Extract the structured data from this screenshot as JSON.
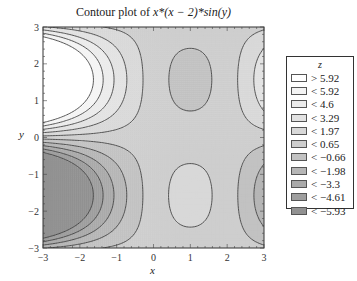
{
  "title": "Contour plot of x*(x − 2)*sin(y)",
  "title_parts": {
    "prefix": "Contour plot of ",
    "expr": "x*(x − 2)*sin(y)"
  },
  "chart_data": {
    "type": "contour",
    "title": "Contour plot of x*(x − 2)*sin(y)",
    "function": "x*(x-2)*sin(y)",
    "xlabel": "x",
    "ylabel": "y",
    "xlim": [
      -3,
      3
    ],
    "ylim": [
      -3,
      3
    ],
    "xticks": [
      -3,
      -2,
      -1,
      0,
      1,
      2,
      3
    ],
    "yticks": [
      -3,
      -2,
      -1,
      0,
      1,
      2,
      3
    ],
    "legend_title": "z",
    "legend_position": "right",
    "levels": [
      5.92,
      4.6,
      3.29,
      1.97,
      0.65,
      -0.66,
      -1.98,
      -3.3,
      -4.61,
      -5.93
    ],
    "legend": [
      {
        "label": "> 5.92",
        "color": "#ffffff"
      },
      {
        "label": "< 5.92",
        "color": "#f4f4f4"
      },
      {
        "label": "< 4.6",
        "color": "#ebebeb"
      },
      {
        "label": "< 3.29",
        "color": "#e2e2e2"
      },
      {
        "label": "< 1.97",
        "color": "#d8d8d8"
      },
      {
        "label": "< 0.65",
        "color": "#cecece"
      },
      {
        "label": "< −0.66",
        "color": "#c2c2c2"
      },
      {
        "label": "< −1.98",
        "color": "#b6b6b6"
      },
      {
        "label": "< −3.3",
        "color": "#aaaaaa"
      },
      {
        "label": "< −4.61",
        "color": "#9e9e9e"
      },
      {
        "label": "< −5.93",
        "color": "#919191"
      }
    ]
  }
}
